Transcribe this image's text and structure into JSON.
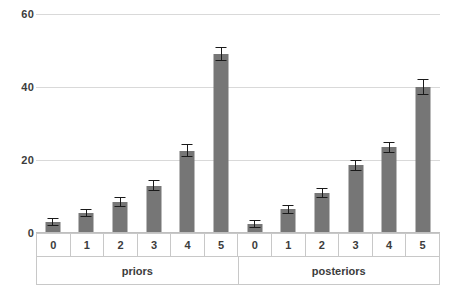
{
  "chart_data": {
    "type": "bar",
    "title": "",
    "subtitle": "",
    "xlabel": "",
    "ylabel": "",
    "ylim": [
      0,
      60
    ],
    "yticks": [
      0,
      20,
      40,
      60
    ],
    "grid": true,
    "legend": false,
    "grouped_categories": [
      {
        "group": "priors",
        "categories": [
          "0",
          "1",
          "2",
          "3",
          "4",
          "5"
        ],
        "values": [
          3,
          5.5,
          8.5,
          13,
          22.5,
          49
        ],
        "errors": [
          1.2,
          1.2,
          1.5,
          1.5,
          1.8,
          2.0
        ]
      },
      {
        "group": "posteriors",
        "categories": [
          "0",
          "1",
          "2",
          "3",
          "4",
          "5"
        ],
        "values": [
          2.5,
          6.5,
          11,
          18.5,
          23.5,
          40
        ],
        "errors": [
          1.0,
          1.2,
          1.3,
          1.5,
          1.5,
          2.2
        ]
      }
    ],
    "colors": {
      "bar": "#767676",
      "error_bar": "#1a1a1a",
      "gridline": "#d9d9d9",
      "axis_line": "#c8c8c8",
      "text": "#3c3c3c",
      "background": "#ffffff"
    }
  }
}
